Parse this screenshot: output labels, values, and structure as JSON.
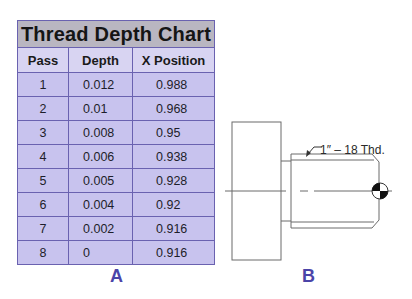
{
  "table": {
    "title": "Thread Depth Chart",
    "columns": [
      "Pass",
      "Depth",
      "X Position"
    ],
    "rows": [
      {
        "pass": "1",
        "depth": "0.012",
        "x": "0.988"
      },
      {
        "pass": "2",
        "depth": "0.01",
        "x": "0.968"
      },
      {
        "pass": "3",
        "depth": "0.008",
        "x": "0.95"
      },
      {
        "pass": "4",
        "depth": "0.006",
        "x": "0.938"
      },
      {
        "pass": "5",
        "depth": "0.005",
        "x": "0.928"
      },
      {
        "pass": "6",
        "depth": "0.004",
        "x": "0.92"
      },
      {
        "pass": "7",
        "depth": "0.002",
        "x": "0.916"
      },
      {
        "pass": "8",
        "depth": "0",
        "x": "0.916"
      }
    ]
  },
  "labels": {
    "a": "A",
    "b": "B"
  },
  "drawing": {
    "callout": "1″ – 18 Thd.",
    "symbol": "center-of-gravity-icon"
  },
  "colors": {
    "title_bg": "#b9b6c1",
    "header_bg": "#d8d4f2",
    "row_bg": "#c8c3ee",
    "border": "#6a62b0",
    "label": "#4b44a8"
  }
}
